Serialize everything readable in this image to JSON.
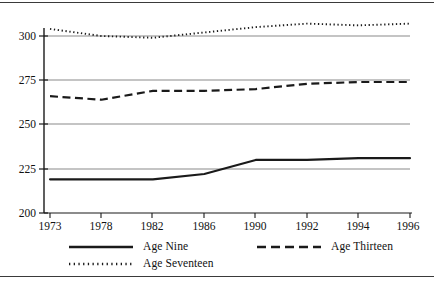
{
  "chart_data": {
    "type": "line",
    "title": "",
    "subtitle": "",
    "xlabel": "",
    "ylabel": "",
    "x": [
      "1973",
      "1978",
      "1982",
      "1986",
      "1990",
      "1992",
      "1994",
      "1996"
    ],
    "categories": [
      "1973",
      "1978",
      "1982",
      "1986",
      "1990",
      "1992",
      "1994",
      "1996"
    ],
    "series": [
      {
        "name": "Age Nine",
        "style": "solid",
        "color": "#1a1a1a",
        "values": [
          219,
          219,
          219,
          222,
          230,
          230,
          231,
          231
        ]
      },
      {
        "name": "Age Thirteen",
        "style": "dashed",
        "color": "#1a1a1a",
        "values": [
          266,
          264,
          269,
          269,
          270,
          273,
          274,
          274
        ]
      },
      {
        "name": "Age Seventeen",
        "style": "dotted",
        "color": "#1a1a1a",
        "values": [
          304,
          300,
          299,
          302,
          305,
          307,
          306,
          307
        ]
      }
    ],
    "ylim": [
      200,
      310
    ],
    "yticks": [
      200,
      225,
      250,
      275,
      300
    ],
    "ytick_labels": [
      "200",
      "225",
      "250",
      "275",
      "300"
    ],
    "xtick_labels": [
      "1973",
      "1978",
      "1982",
      "1986",
      "1990",
      "1992",
      "1994",
      "1996"
    ],
    "grid": true,
    "grid_color": "#8a8a8a",
    "axis_color": "#1a1a1a",
    "legend_position": "bottom"
  },
  "legend": {
    "items": [
      {
        "label": "Age Nine",
        "style": "solid",
        "name": "legend-item-age-nine"
      },
      {
        "label": "Age Thirteen",
        "style": "dashed",
        "name": "legend-item-age-thirteen"
      },
      {
        "label": "Age Seventeen",
        "style": "dotted",
        "name": "legend-item-age-seventeen"
      }
    ]
  },
  "axis": {
    "y_ticks": [
      "300",
      "275",
      "250",
      "225",
      "200"
    ],
    "x_ticks": [
      "1973",
      "1978",
      "1982",
      "1986",
      "1990",
      "1992",
      "1994",
      "1996"
    ]
  }
}
